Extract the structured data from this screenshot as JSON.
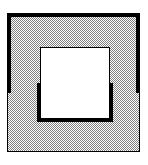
{
  "figure": {
    "type": "technical-line-drawing",
    "caption": "",
    "canvas": {
      "width": 148,
      "height": 165,
      "background_color": "#ffffff"
    },
    "colors": {
      "line": "#000000",
      "hatch_dark": "#808080",
      "hatch_light": "#ffffff",
      "void_fill": "#ffffff",
      "background": "#ffffff"
    },
    "hatch": {
      "name": "checkerboard-stipple",
      "pattern_type": "dither-50-percent",
      "cell_size_px": 2,
      "coverage_percent": 50,
      "description": "fine alternating black-and-white pixel checkerboard giving a 50% gray tone"
    },
    "outer_frame": {
      "name": "outer-square",
      "x": 7,
      "y": 13,
      "width": 133,
      "height": 139,
      "fill": "hatched",
      "stroke_color": "#000000",
      "edges": [
        {
          "name": "outer-top-edge",
          "orientation": "horizontal",
          "weight": "thick",
          "stroke_width_px": 4
        },
        {
          "name": "outer-left-edge",
          "orientation": "vertical",
          "weight": "thick-then-thin",
          "thick_stroke_width_px": 4,
          "thin_stroke_width_px": 1,
          "transition_y": 93
        },
        {
          "name": "outer-right-edge",
          "orientation": "vertical",
          "weight": "thick-then-thin",
          "thick_stroke_width_px": 4,
          "thin_stroke_width_px": 1,
          "transition_y": 93
        },
        {
          "name": "outer-bottom-edge",
          "orientation": "horizontal",
          "weight": "thin",
          "stroke_width_px": 1
        }
      ]
    },
    "inner_void": {
      "name": "inner-square-void",
      "x": 40,
      "y": 47,
      "width": 70,
      "height": 71,
      "fill": "#ffffff",
      "stroke_color": "#000000",
      "edges": [
        {
          "name": "inner-top-edge",
          "orientation": "horizontal",
          "weight": "thin",
          "stroke_width_px": 1
        },
        {
          "name": "inner-left-edge",
          "orientation": "vertical",
          "weight": "thin-then-thick",
          "thin_stroke_width_px": 1,
          "thick_stroke_width_px": 4,
          "transition_y": 83
        },
        {
          "name": "inner-right-edge",
          "orientation": "vertical",
          "weight": "thin-then-thick",
          "thin_stroke_width_px": 1,
          "thick_stroke_width_px": 4,
          "transition_y": 83
        },
        {
          "name": "inner-bottom-edge",
          "orientation": "horizontal",
          "weight": "thick",
          "stroke_width_px": 4
        }
      ]
    },
    "labels": {
      "outer_region_label": "",
      "inner_region_label": "",
      "dimensions_shown": "none"
    }
  }
}
